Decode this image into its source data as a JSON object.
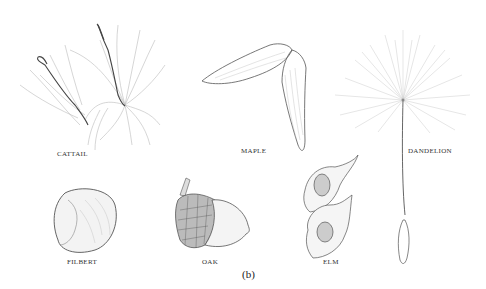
{
  "figure": {
    "caption": "(b)",
    "specimens": [
      {
        "id": "cattail",
        "label": "CATTAIL"
      },
      {
        "id": "maple",
        "label": "MAPLE"
      },
      {
        "id": "dandelion",
        "label": "DANDELION"
      },
      {
        "id": "filbert",
        "label": "FILBERT"
      },
      {
        "id": "oak",
        "label": "OAK"
      },
      {
        "id": "elm",
        "label": "ELM"
      }
    ]
  },
  "colors": {
    "ink": "#333333",
    "light_ink": "#aaaaaa",
    "background": "#ffffff"
  }
}
